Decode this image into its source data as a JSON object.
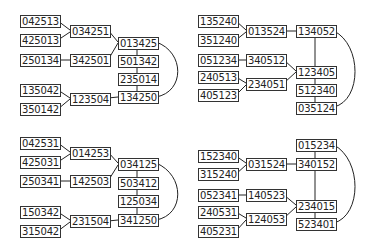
{
  "panels": [
    {
      "nodes": [
        {
          "id": "a",
          "label": "042513",
          "x": 20,
          "y": 15
        },
        {
          "id": "b",
          "label": "425013",
          "x": 20,
          "y": 34
        },
        {
          "id": "c",
          "label": "034251",
          "x": 70,
          "y": 25
        },
        {
          "id": "d",
          "label": "250134",
          "x": 20,
          "y": 54
        },
        {
          "id": "e",
          "label": "342501",
          "x": 70,
          "y": 54
        },
        {
          "id": "f",
          "label": "013425",
          "x": 118,
          "y": 37
        },
        {
          "id": "g",
          "label": "501342",
          "x": 118,
          "y": 55
        },
        {
          "id": "h",
          "label": "235014",
          "x": 118,
          "y": 73
        },
        {
          "id": "i",
          "label": "134250",
          "x": 118,
          "y": 91
        },
        {
          "id": "j",
          "label": "135042",
          "x": 20,
          "y": 84
        },
        {
          "id": "k",
          "label": "350142",
          "x": 20,
          "y": 103
        },
        {
          "id": "l",
          "label": "123504",
          "x": 70,
          "y": 93
        }
      ]
    },
    {
      "nodes": [
        {
          "id": "a",
          "label": "135240",
          "x": 198,
          "y": 15
        },
        {
          "id": "b",
          "label": "351240",
          "x": 198,
          "y": 34
        },
        {
          "id": "c",
          "label": "013524",
          "x": 246,
          "y": 25
        },
        {
          "id": "d",
          "label": "134052",
          "x": 296,
          "y": 25
        },
        {
          "id": "e",
          "label": "051234",
          "x": 198,
          "y": 54
        },
        {
          "id": "f",
          "label": "340512",
          "x": 246,
          "y": 54
        },
        {
          "id": "g",
          "label": "123405",
          "x": 296,
          "y": 66
        },
        {
          "id": "h",
          "label": "240513",
          "x": 198,
          "y": 71
        },
        {
          "id": "i",
          "label": "234051",
          "x": 246,
          "y": 78
        },
        {
          "id": "j",
          "label": "405123",
          "x": 198,
          "y": 89
        },
        {
          "id": "k",
          "label": "512340",
          "x": 296,
          "y": 84
        },
        {
          "id": "l",
          "label": "035124",
          "x": 296,
          "y": 102
        }
      ]
    },
    {
      "nodes": [
        {
          "id": "a",
          "label": "042531",
          "x": 20,
          "y": 137
        },
        {
          "id": "b",
          "label": "425031",
          "x": 20,
          "y": 156
        },
        {
          "id": "c",
          "label": "014253",
          "x": 70,
          "y": 147
        },
        {
          "id": "d",
          "label": "250341",
          "x": 20,
          "y": 175
        },
        {
          "id": "e",
          "label": "142503",
          "x": 70,
          "y": 175
        },
        {
          "id": "f",
          "label": "034125",
          "x": 118,
          "y": 158
        },
        {
          "id": "g",
          "label": "503412",
          "x": 118,
          "y": 177
        },
        {
          "id": "h",
          "label": "125034",
          "x": 118,
          "y": 195
        },
        {
          "id": "i",
          "label": "341250",
          "x": 118,
          "y": 214
        },
        {
          "id": "j",
          "label": "150342",
          "x": 20,
          "y": 206
        },
        {
          "id": "k",
          "label": "315042",
          "x": 20,
          "y": 225
        },
        {
          "id": "l",
          "label": "231504",
          "x": 70,
          "y": 215
        }
      ]
    },
    {
      "nodes": [
        {
          "id": "a",
          "label": "015234",
          "x": 296,
          "y": 139
        },
        {
          "id": "b",
          "label": "152340",
          "x": 198,
          "y": 150
        },
        {
          "id": "c",
          "label": "031524",
          "x": 246,
          "y": 158
        },
        {
          "id": "d",
          "label": "340152",
          "x": 296,
          "y": 158
        },
        {
          "id": "e",
          "label": "315240",
          "x": 198,
          "y": 168
        },
        {
          "id": "f",
          "label": "052341",
          "x": 198,
          "y": 189
        },
        {
          "id": "g",
          "label": "140523",
          "x": 246,
          "y": 189
        },
        {
          "id": "h",
          "label": "240531",
          "x": 198,
          "y": 206
        },
        {
          "id": "i",
          "label": "234015",
          "x": 296,
          "y": 200
        },
        {
          "id": "j",
          "label": "124053",
          "x": 246,
          "y": 213
        },
        {
          "id": "k",
          "label": "523401",
          "x": 296,
          "y": 218
        },
        {
          "id": "l",
          "label": "405231",
          "x": 198,
          "y": 225
        }
      ]
    }
  ]
}
